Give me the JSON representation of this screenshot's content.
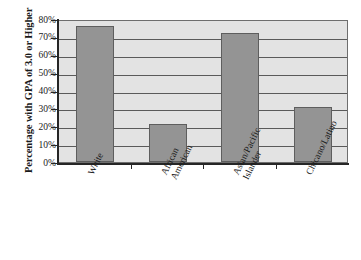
{
  "chart_data": {
    "type": "bar",
    "title": "",
    "subtitle": "",
    "xlabel": "",
    "ylabel": "Percentage with GPA of 3.0 or Higher",
    "categories": [
      "White",
      "African American",
      "Asian/Pacific Islander",
      "Chicano/Latino"
    ],
    "category_lines": [
      [
        "White"
      ],
      [
        "African",
        "American"
      ],
      [
        "Asian/Pacific",
        "Islander"
      ],
      [
        "Chicano/Latino"
      ]
    ],
    "values": [
      76,
      21,
      72,
      31
    ],
    "ylim": [
      0,
      80
    ],
    "ytick_values": [
      0,
      10,
      20,
      30,
      40,
      50,
      60,
      70,
      80
    ],
    "ytick_labels": [
      "0%",
      "10%",
      "20%",
      "30%",
      "40%",
      "50%",
      "60%",
      "70%",
      "80%"
    ],
    "grid": true,
    "grid_axis": "y",
    "legend": false,
    "legend_position": "none",
    "series": [
      {
        "name": "Percentage with GPA of 3.0 or Higher",
        "values": [
          76,
          21,
          72,
          31
        ]
      }
    ],
    "colors": {
      "bar_fill": "#949494",
      "bar_border": "#5e5e5e",
      "plot_background": "#e3e3e3",
      "gridline": "#5a5a5a",
      "axis": "#262626",
      "text": "#1a1a1a",
      "page_background": "#ffffff"
    }
  }
}
